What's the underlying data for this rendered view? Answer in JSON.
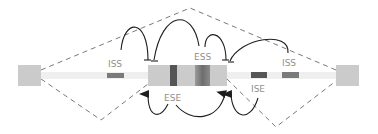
{
  "diagram": {
    "type": "splicing-regulation",
    "labels": {
      "iss_left": "ISS",
      "iss_right": "ISS",
      "ess": "ESS",
      "ese": "ESE",
      "ise": "ISE"
    },
    "colors": {
      "exon": "#cbcbcb",
      "intron": "#efefef",
      "dashed_line": "#6a6a6a",
      "arrow": "#1e1e1e",
      "element_dark": "#555555",
      "element_mid": "#7a7a7a",
      "label": "#8f8f8f"
    },
    "elements": [
      {
        "name": "upstream-exon"
      },
      {
        "name": "upstream-intron",
        "contains": [
          "ISS"
        ]
      },
      {
        "name": "alternative-exon",
        "contains": [
          "ESE",
          "ESS"
        ]
      },
      {
        "name": "downstream-intron",
        "contains": [
          "ISE",
          "ISS"
        ]
      },
      {
        "name": "downstream-exon"
      }
    ],
    "interactions": [
      {
        "from": "ISS (upstream intron)",
        "to": "3' splice site",
        "effect": "inhibit"
      },
      {
        "from": "ESS",
        "to": "3' splice site",
        "effect": "inhibit"
      },
      {
        "from": "ESS",
        "to": "5' splice site",
        "effect": "inhibit"
      },
      {
        "from": "ISS (downstream intron)",
        "to": "5' splice site",
        "effect": "inhibit"
      },
      {
        "from": "ESE",
        "to": "3' splice site",
        "effect": "activate"
      },
      {
        "from": "ESE",
        "to": "5' splice site",
        "effect": "activate"
      },
      {
        "from": "ISE",
        "to": "5' splice site",
        "effect": "activate"
      }
    ]
  }
}
